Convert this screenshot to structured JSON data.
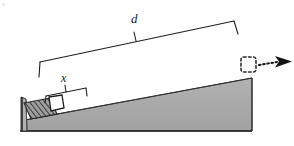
{
  "figure": {
    "kind": "physics-diagram",
    "background_color": "#ffffff",
    "corner_artifact": "s",
    "labels": {
      "distance_d": "d",
      "compression_x": "x"
    },
    "colors": {
      "ink": "#1a1a1a",
      "ramp_fill": "#a9a9a9",
      "ramp_fill_light": "#b4b4b4",
      "ramp_edge": "#3a3a3a",
      "block_fill": "#ffffff",
      "spring_fill": "#9a9a9a",
      "spring_hatch": "#2b2b2b",
      "dashed_outline": "#333333",
      "arrow": "#161616"
    },
    "geometry": {
      "ramp": {
        "apex_top_right": [
          252,
          78
        ],
        "bottom_right": [
          252,
          131
        ],
        "bottom_left": [
          21,
          131
        ],
        "incline_foot": [
          25,
          120
        ]
      },
      "back_wall": {
        "x": 22,
        "y_top": 97,
        "y_bottom": 131
      },
      "spring": {
        "compressed": true,
        "hatch_lines": 9
      },
      "block": {
        "width": 13,
        "height": 12,
        "position": "at spring end on incline"
      },
      "ghost_block": {
        "style": "dashed",
        "position": [
          248,
          64
        ],
        "size": 15
      },
      "velocity_arrow": {
        "style": "dotted-shaft-solid-head",
        "direction": "right",
        "from": [
          264,
          66
        ],
        "to": [
          290,
          63
        ]
      },
      "dimension_d": {
        "from": [
          40,
          62
        ],
        "to": [
          234,
          21
        ],
        "tick_left": true,
        "tick_right": true,
        "tick_center": true
      },
      "dimension_x": {
        "from": [
          46,
          96
        ],
        "to": [
          86,
          88
        ],
        "tick_left": true,
        "tick_right": true,
        "tick_center": true
      }
    }
  }
}
